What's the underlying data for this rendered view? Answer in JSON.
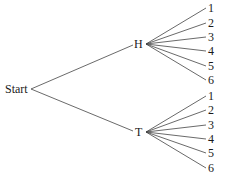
{
  "diagram": {
    "type": "tree",
    "root": {
      "label": "Start"
    },
    "level1": [
      {
        "label": "H",
        "children": [
          "1",
          "2",
          "3",
          "4",
          "5",
          "6"
        ]
      },
      {
        "label": "T",
        "children": [
          "1",
          "2",
          "3",
          "4",
          "5",
          "6"
        ]
      }
    ]
  }
}
